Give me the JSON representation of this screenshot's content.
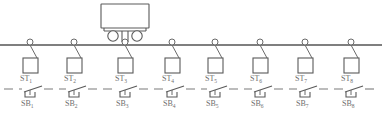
{
  "diagram": {
    "colors": {
      "line": "#5a5a5a",
      "rail": "#555555",
      "dashed_line": "#7a7a7a",
      "text": "#6e6e6e",
      "background": "#ffffff"
    },
    "rail": {
      "name": "overhead rail",
      "y": 45,
      "x_start": 0,
      "x_end": 382
    },
    "trolley": {
      "name": "trolley",
      "body_x": 101,
      "body_y": 4,
      "body_width": 48,
      "body_height": 24,
      "wheel_radius": 5,
      "wheel_left_cx": 113,
      "wheel_right_cx": 137,
      "wheel_cy": 36,
      "hanger_x": 125
    },
    "stations": [
      {
        "label": "ST",
        "sub": "1",
        "x": 30
      },
      {
        "label": "ST",
        "sub": "2",
        "x": 74
      },
      {
        "label": "ST",
        "sub": "3",
        "x": 125
      },
      {
        "label": "ST",
        "sub": "4",
        "x": 172
      },
      {
        "label": "ST",
        "sub": "5",
        "x": 215
      },
      {
        "label": "ST",
        "sub": "6",
        "x": 260
      },
      {
        "label": "ST",
        "sub": "7",
        "x": 305
      },
      {
        "label": "ST",
        "sub": "8",
        "x": 351
      }
    ],
    "switches": [
      {
        "label": "SB",
        "sub": "1",
        "x": 30
      },
      {
        "label": "SB",
        "sub": "2",
        "x": 74
      },
      {
        "label": "SB",
        "sub": "3",
        "x": 125
      },
      {
        "label": "SB",
        "sub": "4",
        "x": 172
      },
      {
        "label": "SB",
        "sub": "5",
        "x": 215
      },
      {
        "label": "SB",
        "sub": "6",
        "x": 260
      },
      {
        "label": "SB",
        "sub": "7",
        "x": 305
      },
      {
        "label": "SB",
        "sub": "8",
        "x": 351
      }
    ],
    "geometry": {
      "hook_radius": 3,
      "hook_cy": 42,
      "rope_drop_dx": 9,
      "rope_drop_y": 58,
      "station_box_size": 14,
      "station_box_y": 58,
      "station_label_y": 80,
      "switch_line_y": 89,
      "switch_label_y": 105
    }
  }
}
